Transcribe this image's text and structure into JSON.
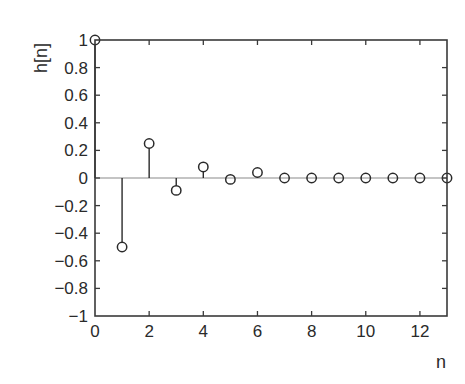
{
  "chart_data": {
    "type": "stem",
    "title": "",
    "xlabel": "n",
    "ylabel": "h[n]",
    "xlim": [
      0,
      13
    ],
    "ylim": [
      -1,
      1
    ],
    "grid": false,
    "legend": null,
    "x": [
      0,
      1,
      2,
      3,
      4,
      5,
      6,
      7,
      8,
      9,
      10,
      11,
      12,
      13
    ],
    "values": [
      1.0,
      -0.5,
      0.25,
      -0.09,
      0.08,
      -0.01,
      0.04,
      0.0,
      0.0,
      0.0,
      0.0,
      0.0,
      0.0,
      0.0
    ],
    "x_ticks": [
      0,
      2,
      4,
      6,
      8,
      10,
      12
    ],
    "x_tick_labels": [
      "0",
      "2",
      "4",
      "6",
      "8",
      "10",
      "12"
    ],
    "y_ticks": [
      1,
      0.8,
      0.6,
      0.4,
      0.2,
      0,
      -0.2,
      -0.4,
      -0.6,
      -0.8,
      -1
    ],
    "y_tick_labels": [
      "1",
      "0.8",
      "0.6",
      "0.4",
      "0.2",
      "0",
      "−0.2",
      "−0.4",
      "−0.6",
      "−0.8",
      "−1"
    ],
    "marker": "open-circle",
    "baseline": 0
  },
  "colors": {
    "axes": "#3a3a3a",
    "stem": "#2a2a2a",
    "baseline": "#b0b0b0",
    "background": "#ffffff"
  },
  "layout": {
    "plot_left": 95,
    "plot_right": 447,
    "plot_top": 40,
    "plot_bottom": 316
  }
}
